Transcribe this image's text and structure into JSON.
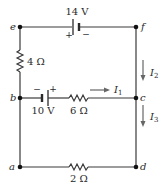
{
  "diagram": {
    "type": "circuit",
    "nodes": [
      {
        "id": "e",
        "label": "e",
        "x": 20,
        "y": 27
      },
      {
        "id": "f",
        "label": "f",
        "x": 136,
        "y": 27
      },
      {
        "id": "b",
        "label": "b",
        "x": 20,
        "y": 98
      },
      {
        "id": "c",
        "label": "c",
        "x": 136,
        "y": 98
      },
      {
        "id": "a",
        "label": "a",
        "x": 20,
        "y": 167
      },
      {
        "id": "d",
        "label": "d",
        "x": 136,
        "y": 167
      }
    ],
    "components": {
      "battery_top": {
        "label": "14 V",
        "plus": "+",
        "minus": "−",
        "between": "e-f"
      },
      "resistor_left": {
        "label": "4 Ω",
        "between": "e-b"
      },
      "battery_middle": {
        "label": "10 V",
        "plus": "+",
        "minus": "−",
        "between": "b-c"
      },
      "resistor_middle": {
        "label": "6 Ω",
        "between": "b-c"
      },
      "resistor_bottom": {
        "label": "2 Ω",
        "between": "a-d"
      }
    },
    "currents": {
      "i1": {
        "label": "I",
        "sub": "1",
        "direction": "right"
      },
      "i2": {
        "label": "I",
        "sub": "2",
        "direction": "down"
      },
      "i3": {
        "label": "I",
        "sub": "3",
        "direction": "down"
      }
    },
    "colors": {
      "wire": "#3a3a3a",
      "node": "#111111",
      "arrow": "#666666",
      "text": "#2a2a2a"
    }
  }
}
